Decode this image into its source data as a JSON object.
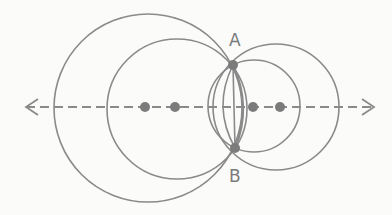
{
  "diagram": {
    "labels": {
      "A": "A",
      "B": "B"
    },
    "colors": {
      "stroke": "#8a8a8a",
      "dot": "#7b7b7b",
      "background": "#fbfbfa"
    },
    "axis": {
      "y": 107,
      "x1": 25,
      "x2": 375,
      "style": "dashed",
      "arrows": "both"
    },
    "intersection_points": [
      {
        "name": "A",
        "x": 233,
        "y": 65
      },
      {
        "name": "B",
        "x": 235,
        "y": 148
      }
    ],
    "centers": [
      145,
      175,
      253,
      280
    ],
    "circles": [
      {
        "cx": 148,
        "cy": 108,
        "r": 94
      },
      {
        "cx": 177,
        "cy": 109,
        "r": 70
      },
      {
        "cx": 276,
        "cy": 107,
        "r": 63
      },
      {
        "cx": 254,
        "cy": 106,
        "r": 46
      }
    ]
  }
}
